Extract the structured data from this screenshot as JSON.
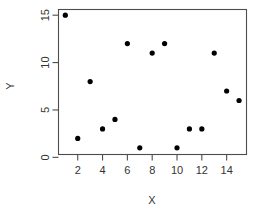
{
  "chart_data": {
    "type": "scatter",
    "title": "",
    "subtitle": "",
    "xlabel": "X",
    "ylabel": "Y",
    "xlim": [
      0.45,
      15.6
    ],
    "ylim": [
      0.3,
      15.6
    ],
    "grid": false,
    "legend": null,
    "x_ticks": [
      2,
      4,
      6,
      8,
      10,
      12,
      14
    ],
    "y_ticks": [
      0,
      5,
      10,
      15
    ],
    "x_tick_labels": [
      "2",
      "4",
      "6",
      "8",
      "10",
      "12",
      "14"
    ],
    "y_tick_labels": [
      "0",
      "5",
      "10",
      "15"
    ],
    "marker": "filled-circle",
    "marker_color": "#000000",
    "x": [
      1,
      2,
      3,
      4,
      5,
      6,
      7,
      8,
      9,
      10,
      11,
      12,
      13,
      14,
      15
    ],
    "y": [
      15,
      2,
      8,
      3,
      4,
      12,
      1,
      11,
      12,
      1,
      3,
      3,
      11,
      7,
      6
    ],
    "points": [
      {
        "x": 1,
        "y": 15
      },
      {
        "x": 2,
        "y": 2
      },
      {
        "x": 3,
        "y": 8
      },
      {
        "x": 4,
        "y": 3
      },
      {
        "x": 5,
        "y": 4
      },
      {
        "x": 6,
        "y": 12
      },
      {
        "x": 7,
        "y": 1
      },
      {
        "x": 8,
        "y": 11
      },
      {
        "x": 9,
        "y": 12
      },
      {
        "x": 10,
        "y": 1
      },
      {
        "x": 11,
        "y": 3
      },
      {
        "x": 12,
        "y": 3
      },
      {
        "x": 13,
        "y": 11
      },
      {
        "x": 14,
        "y": 7
      },
      {
        "x": 15,
        "y": 6
      }
    ]
  },
  "colors": {
    "axis": "#4d4d4d",
    "text": "#333333",
    "marker": "#000000",
    "background": "#ffffff"
  }
}
